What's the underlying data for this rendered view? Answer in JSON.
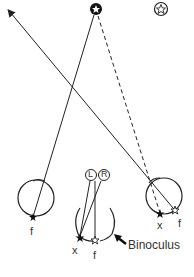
{
  "diagram": {
    "type": "binocular vision / strabismus schematic",
    "objects": [
      {
        "id": "fixation-object",
        "style": "filled-circle-with-star",
        "x": 96,
        "y": 9
      },
      {
        "id": "false-image-object",
        "style": "outlined-circle-with-star",
        "x": 161,
        "y": 9
      }
    ],
    "eyes": [
      {
        "id": "left-eye",
        "label_f": "f"
      },
      {
        "id": "right-eye",
        "label_x": "x",
        "label_f": "f"
      },
      {
        "id": "binoculus",
        "label_x": "x",
        "label_f": "f",
        "badge_left": "L",
        "badge_right": "R"
      }
    ],
    "labels": {
      "left_eye_f": "f",
      "right_eye_x": "x",
      "right_eye_f": "f",
      "binoculus_x": "x",
      "binoculus_f": "f",
      "badge_L": "L",
      "badge_R": "R",
      "binoculus": "Binoculus"
    },
    "colors": {
      "line": "#222222",
      "background": "#ffffff"
    }
  }
}
